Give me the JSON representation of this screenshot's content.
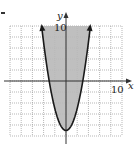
{
  "item_marker": ".",
  "chart_data": {
    "type": "line",
    "title": "",
    "function": "y = x^2 - 9",
    "inequality": "y >= x^2 - 9",
    "shaded_region": "inside (above) the parabola",
    "xlabel": "x",
    "ylabel": "y",
    "xlim": [
      -10,
      10
    ],
    "ylim": [
      -10,
      10
    ],
    "x_tick_label": "10",
    "y_tick_label": "10",
    "grid": true,
    "grid_step": 2,
    "boundary": "solid",
    "vertex": [
      0,
      -9
    ],
    "x_intercepts": [
      -3,
      3
    ],
    "series": [
      {
        "name": "parabola",
        "x": [
          -4.36,
          -4,
          -3,
          -2,
          -1,
          0,
          1,
          2,
          3,
          4,
          4.36
        ],
        "y": [
          10,
          7,
          0,
          -5,
          -8,
          -9,
          -8,
          -5,
          0,
          7,
          10
        ]
      }
    ],
    "colors": {
      "shade": "#b8b8b8",
      "curve": "#1a1a1a",
      "grid": "#9a9a9a",
      "axis": "#333333"
    }
  }
}
